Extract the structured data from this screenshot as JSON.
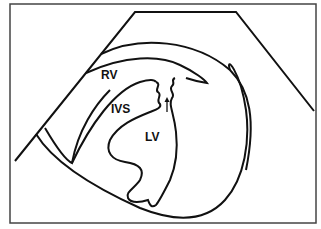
{
  "diagram": {
    "type": "echocardiogram schematic",
    "labels": {
      "rv": "RV",
      "ivs": "IVS",
      "lv": "LV"
    },
    "annotations": {
      "arrow": "arrow pointing upward at septal gap"
    },
    "colors": {
      "stroke": "#111111",
      "frame": "#444444",
      "background": "#ffffff"
    }
  }
}
